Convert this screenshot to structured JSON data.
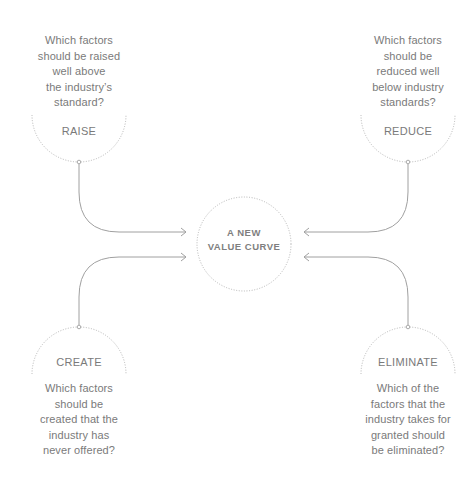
{
  "center": {
    "title": "A NEW\nVALUE CURVE"
  },
  "quadrants": {
    "raise": {
      "label": "RAISE",
      "question": "Which factors\nshould be raised\nwell above\nthe industry’s\nstandard?"
    },
    "reduce": {
      "label": "REDUCE",
      "question": "Which factors\nshould be\nreduced well\nbelow industry\nstandards?"
    },
    "create": {
      "label": "CREATE",
      "question": "Which factors\nshould be\ncreated that the\nindustry has\nnever offered?"
    },
    "eliminate": {
      "label": "ELIMINATE",
      "question": "Which of the\nfactors that the\nindustry takes for\ngranted should\nbe eliminated?"
    }
  },
  "colors": {
    "text": "#7a7a7a",
    "line": "#a0a0a0",
    "dotted": "#b5b5b5",
    "background": "#ffffff"
  }
}
